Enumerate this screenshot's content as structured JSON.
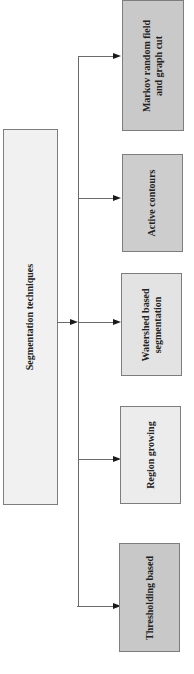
{
  "diagram": {
    "root": {
      "label": "Segmentation techniques",
      "fill": "#f1f1f1"
    },
    "children": [
      {
        "label_line1": "Markov random field",
        "label_line2": "and graph cut",
        "fill": "#c9c9c9"
      },
      {
        "label_line1": "Active contours",
        "label_line2": "",
        "fill": "#cdcdcd"
      },
      {
        "label_line1": "Watershed based",
        "label_line2": "segmentation",
        "fill": "#e3e3e3"
      },
      {
        "label_line1": "Region growing",
        "label_line2": "",
        "fill": "#ececec"
      },
      {
        "label_line1": "Thresholding based",
        "label_line2": "",
        "fill": "#c8c8c8"
      }
    ],
    "colors": {
      "line": "#6a6a6a",
      "arrow": "#1a1a1a",
      "border": "#7d7d7d"
    }
  }
}
